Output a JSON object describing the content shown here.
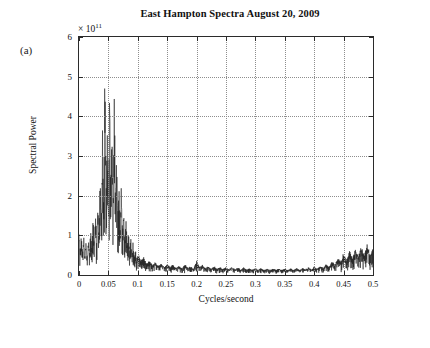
{
  "figure": {
    "panel_label": "(a)",
    "title": "East Hampton Spectra August 20, 2009",
    "exponent_label": "× 10",
    "exponent_sup": "11"
  },
  "chart_data": {
    "type": "line",
    "title": "East Hampton Spectra August 20, 2009",
    "xlabel": "Cycles/second",
    "ylabel": "Spectral Power",
    "xlim": [
      0,
      0.5
    ],
    "ylim": [
      0,
      6
    ],
    "y_scale_factor": "1e11",
    "grid": true,
    "legend": null,
    "xticks": [
      0,
      0.05,
      0.1,
      0.15,
      0.2,
      0.25,
      0.3,
      0.35,
      0.4,
      0.45,
      0.5
    ],
    "xticklabels": [
      "0",
      "0.05",
      "0.1",
      "0.15",
      "0.2",
      "0.25",
      "0.3",
      "0.35",
      "0.4",
      "0.45",
      "0.5"
    ],
    "yticks": [
      0,
      1,
      2,
      3,
      4,
      5,
      6
    ],
    "yticklabels": [
      "0",
      "1",
      "2",
      "3",
      "4",
      "5",
      "6"
    ],
    "series": [
      {
        "name": "Spectral Power",
        "color": "#1a1a1a",
        "x": [
          0.0,
          0.002,
          0.004,
          0.006,
          0.008,
          0.01,
          0.012,
          0.014,
          0.016,
          0.018,
          0.02,
          0.022,
          0.024,
          0.026,
          0.028,
          0.03,
          0.032,
          0.034,
          0.036,
          0.038,
          0.04,
          0.042,
          0.044,
          0.046,
          0.048,
          0.05,
          0.052,
          0.054,
          0.056,
          0.058,
          0.06,
          0.062,
          0.064,
          0.066,
          0.068,
          0.07,
          0.072,
          0.074,
          0.076,
          0.078,
          0.08,
          0.082,
          0.084,
          0.086,
          0.088,
          0.09,
          0.092,
          0.094,
          0.096,
          0.098,
          0.1,
          0.105,
          0.11,
          0.115,
          0.12,
          0.125,
          0.13,
          0.135,
          0.14,
          0.145,
          0.15,
          0.155,
          0.16,
          0.165,
          0.17,
          0.175,
          0.18,
          0.185,
          0.19,
          0.195,
          0.2,
          0.205,
          0.21,
          0.215,
          0.22,
          0.225,
          0.23,
          0.235,
          0.24,
          0.245,
          0.25,
          0.255,
          0.26,
          0.265,
          0.27,
          0.275,
          0.28,
          0.285,
          0.29,
          0.295,
          0.3,
          0.305,
          0.31,
          0.315,
          0.32,
          0.325,
          0.33,
          0.335,
          0.34,
          0.345,
          0.35,
          0.355,
          0.36,
          0.365,
          0.37,
          0.375,
          0.38,
          0.385,
          0.39,
          0.395,
          0.4,
          0.405,
          0.41,
          0.415,
          0.42,
          0.425,
          0.43,
          0.435,
          0.44,
          0.445,
          0.45,
          0.455,
          0.46,
          0.465,
          0.47,
          0.475,
          0.48,
          0.485,
          0.49,
          0.495,
          0.5
        ],
        "y": [
          0.95,
          0.55,
          0.85,
          0.45,
          0.9,
          0.4,
          0.75,
          0.35,
          0.8,
          0.5,
          1.05,
          0.6,
          1.2,
          0.7,
          1.35,
          0.8,
          1.55,
          0.95,
          2.3,
          1.2,
          3.05,
          1.45,
          4.55,
          1.9,
          3.1,
          1.5,
          4.35,
          2.0,
          3.2,
          1.45,
          4.3,
          1.7,
          2.6,
          1.2,
          2.05,
          1.0,
          1.95,
          0.95,
          1.4,
          0.7,
          1.3,
          0.6,
          1.05,
          0.5,
          0.85,
          0.42,
          0.7,
          0.35,
          0.55,
          0.3,
          0.45,
          0.32,
          0.38,
          0.25,
          0.3,
          0.22,
          0.28,
          0.2,
          0.26,
          0.18,
          0.24,
          0.17,
          0.22,
          0.16,
          0.2,
          0.15,
          0.22,
          0.16,
          0.18,
          0.14,
          0.3,
          0.18,
          0.22,
          0.15,
          0.2,
          0.14,
          0.19,
          0.13,
          0.18,
          0.13,
          0.17,
          0.12,
          0.17,
          0.12,
          0.16,
          0.12,
          0.16,
          0.11,
          0.15,
          0.11,
          0.15,
          0.11,
          0.15,
          0.11,
          0.14,
          0.11,
          0.14,
          0.11,
          0.14,
          0.11,
          0.14,
          0.11,
          0.14,
          0.11,
          0.15,
          0.11,
          0.15,
          0.12,
          0.16,
          0.12,
          0.18,
          0.13,
          0.2,
          0.15,
          0.24,
          0.17,
          0.3,
          0.22,
          0.38,
          0.28,
          0.46,
          0.32,
          0.52,
          0.36,
          0.58,
          0.4,
          0.62,
          0.42,
          0.66,
          0.45,
          0.6
        ]
      }
    ]
  }
}
